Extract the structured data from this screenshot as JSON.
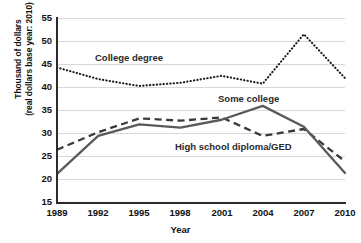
{
  "chart_data": {
    "type": "line",
    "title": "",
    "xlabel": "Year",
    "ylabel": "Thousand of dollars (real dollars base year: 2010)",
    "ylabel_line1": "Thousand of dollars",
    "ylabel_line2": "(real dollars base year: 2010)",
    "categories": [
      "1989",
      "1992",
      "1995",
      "1998",
      "2001",
      "2004",
      "2007",
      "2010"
    ],
    "x": [
      1989,
      1992,
      1995,
      1998,
      2001,
      2004,
      2007,
      2010
    ],
    "xlim": [
      1989,
      2010
    ],
    "ylim": [
      15,
      55
    ],
    "yticks": [
      "55",
      "50",
      "45",
      "40",
      "35",
      "30",
      "25",
      "20",
      "15"
    ],
    "ytick_values": [
      55,
      50,
      45,
      40,
      35,
      30,
      25,
      20,
      15
    ],
    "grid": true,
    "grid_axis": "y",
    "legend_position": "inline-annotations",
    "series": [
      {
        "name": "College degree",
        "style": "dotted",
        "color": "#1a1a1a",
        "values": [
          44.3,
          41.8,
          40.3,
          41.0,
          42.5,
          40.8,
          51.5,
          42.0
        ]
      },
      {
        "name": "Some college",
        "style": "solid",
        "color": "#5a5a5a",
        "values": [
          21.3,
          29.5,
          32.0,
          31.3,
          33.0,
          36.0,
          31.5,
          21.5
        ]
      },
      {
        "name": "High school diploma/GED",
        "style": "dashed",
        "color": "#3a3a3a",
        "values": [
          26.5,
          30.3,
          33.3,
          32.8,
          33.5,
          29.5,
          31.0,
          24.0
        ]
      }
    ],
    "annotations": [
      {
        "text": "College degree",
        "series": "College degree"
      },
      {
        "text": "Some college",
        "series": "Some college"
      },
      {
        "text": "High school diploma/GED",
        "series": "High school diploma/GED"
      }
    ]
  }
}
